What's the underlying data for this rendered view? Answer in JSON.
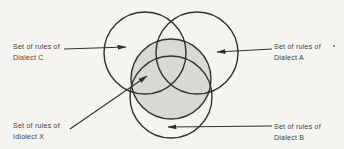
{
  "figure": {
    "type": "venn-diagram",
    "background": "#f5f4f0",
    "line_color": "#33312c",
    "text_color": "#44423b",
    "shaded_fill": "#d9d9d3",
    "circles": [
      {
        "name": "idiolect-x-circle",
        "cx": 171,
        "cy": 79,
        "r": 40,
        "shaded": true
      },
      {
        "name": "dialect-c-circle",
        "cx": 145,
        "cy": 53,
        "r": 41,
        "shaded": false
      },
      {
        "name": "dialect-a-circle",
        "cx": 197,
        "cy": 53,
        "r": 41,
        "shaded": false
      },
      {
        "name": "dialect-b-circle",
        "cx": 171,
        "cy": 97,
        "r": 41,
        "shaded": false
      }
    ],
    "arrows": [
      {
        "name": "dialect-c-arrow",
        "x1": 64,
        "y1": 49,
        "x2": 126,
        "y2": 47
      },
      {
        "name": "dialect-a-arrow",
        "x1": 272,
        "y1": 49,
        "x2": 217,
        "y2": 52
      },
      {
        "name": "idiolect-x-arrow",
        "x1": 70,
        "y1": 129,
        "x2": 147,
        "y2": 76
      },
      {
        "name": "dialect-b-arrow",
        "x1": 272,
        "y1": 126,
        "x2": 168,
        "y2": 127
      }
    ],
    "labels": {
      "dialect_c": {
        "line1": "Set of rules of",
        "line2": "Dialect C"
      },
      "dialect_a": {
        "line1": "Set of rules of",
        "line2": "Dialect A"
      },
      "idiolect_x": {
        "line1": "Set of rules of",
        "line2": "Idiolect X"
      },
      "dialect_b": {
        "line1": "Set of rules of",
        "line2": "Dialect B"
      }
    }
  }
}
